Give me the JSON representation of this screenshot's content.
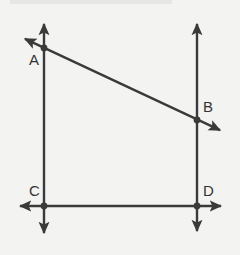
{
  "figure": {
    "kind": "geometry-diagram",
    "background_color": "#f3f3f1",
    "stroke_color": "#3a3a3a",
    "label_color": "#333333",
    "canvas": {
      "width": 240,
      "height": 255
    },
    "points": [
      {
        "id": "A",
        "label": "A",
        "x": 44,
        "y": 48,
        "label_x": 29,
        "label_y": 52
      },
      {
        "id": "B",
        "label": "B",
        "x": 197,
        "y": 120,
        "label_x": 203,
        "label_y": 99
      },
      {
        "id": "C",
        "label": "C",
        "x": 44,
        "y": 206,
        "label_x": 29,
        "label_y": 183
      },
      {
        "id": "D",
        "label": "D",
        "x": 197,
        "y": 206,
        "label_x": 203,
        "label_y": 183
      }
    ],
    "lines": [
      {
        "id": "left-vertical-line",
        "name": "line-AC",
        "through": [
          "A",
          "C"
        ],
        "x1": 44,
        "y1": 20,
        "x2": 44,
        "y2": 237,
        "arrow_start": true,
        "arrow_end": true
      },
      {
        "id": "right-vertical-line",
        "name": "line-BD",
        "through": [
          "B",
          "D"
        ],
        "x1": 197,
        "y1": 20,
        "x2": 197,
        "y2": 235,
        "arrow_start": true,
        "arrow_end": true
      },
      {
        "id": "transversal-line",
        "name": "line-AB",
        "through": [
          "A",
          "B"
        ],
        "x1": 21,
        "y1": 37,
        "x2": 224,
        "y2": 132,
        "arrow_start": true,
        "arrow_end": true
      },
      {
        "id": "horizontal-line",
        "name": "line-CD",
        "through": [
          "C",
          "D"
        ],
        "x1": 16,
        "y1": 206,
        "x2": 225,
        "y2": 206,
        "arrow_start": true,
        "arrow_end": true
      }
    ]
  }
}
